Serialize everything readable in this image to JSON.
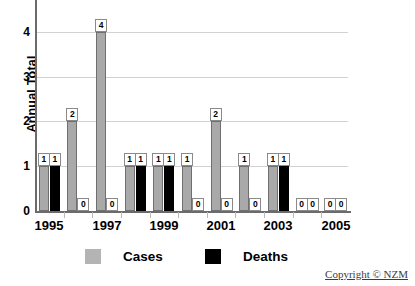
{
  "chart_data": {
    "type": "bar",
    "title": "",
    "xlabel": "",
    "ylabel": "Annual Total",
    "ylim": [
      0,
      4.6
    ],
    "yticks": [
      0,
      1,
      2,
      3,
      4
    ],
    "grid": true,
    "legend_position": "bottom-center",
    "categories": [
      "1995",
      "1996",
      "1997",
      "1998",
      "1999",
      "2000",
      "2001",
      "2002",
      "2003",
      "2004",
      "2005"
    ],
    "tick_labels": [
      "1995",
      "",
      "1997",
      "",
      "1999",
      "",
      "2001",
      "",
      "2003",
      "",
      "2005"
    ],
    "series": [
      {
        "name": "Cases",
        "color": "#a9a9a9",
        "values": [
          1,
          2,
          4,
          1,
          1,
          1,
          2,
          1,
          1,
          0,
          0
        ],
        "data_labels": [
          "1",
          "2",
          "4",
          "1",
          "1",
          "1",
          "2",
          "1",
          "1",
          "0",
          "0"
        ]
      },
      {
        "name": "Deaths",
        "color": "#000000",
        "values": [
          1,
          0,
          0,
          1,
          1,
          0,
          0,
          0,
          1,
          0,
          0
        ],
        "data_labels": [
          "1",
          "0",
          "0",
          "1",
          "1",
          "0",
          "0",
          "0",
          "1",
          "0",
          "0"
        ]
      }
    ]
  },
  "legend": {
    "items": [
      {
        "label": "Cases",
        "swatch": "cases-swatch"
      },
      {
        "label": "Deaths",
        "swatch": "deaths-swatch"
      }
    ]
  },
  "footer": {
    "copyright": "Copyright © NZM"
  }
}
